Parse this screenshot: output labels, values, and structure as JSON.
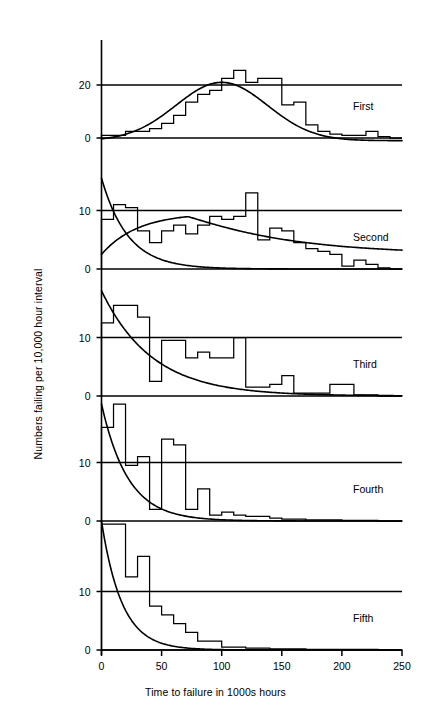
{
  "figure": {
    "ylabel": "Numbers failing per 10,000 hour interval",
    "xlabel": "Time to failure in 1000s hours",
    "top_cropped_caption": "",
    "width": 431,
    "height": 713,
    "line_color": "#000000",
    "background": "#ffffff"
  },
  "chart_data": {
    "type": "line",
    "title": "",
    "subtitle": "",
    "xlabel": "Time to failure in 1000s hours",
    "ylabel": "Numbers failing per 10,000 hour interval",
    "xlim": [
      0,
      250
    ],
    "xticks": [
      0,
      50,
      100,
      150,
      200,
      250
    ],
    "xticklabels": [
      "0",
      "50",
      "100",
      "150",
      "200",
      "250"
    ],
    "grid": false,
    "legend": "none",
    "annotations": [
      "First",
      "Second",
      "Third",
      "Fourth",
      "Fifth"
    ],
    "panel_layout": "5 stacked panels sharing one x-axis",
    "panels": [
      {
        "label": "First",
        "ylim": [
          0,
          26
        ],
        "yticks": [
          0,
          20
        ],
        "yticklabels": [
          "0",
          "20"
        ],
        "bin_width": 10,
        "bin_edges": [
          0,
          10,
          20,
          30,
          40,
          50,
          60,
          70,
          80,
          90,
          100,
          110,
          120,
          130,
          140,
          150,
          160,
          170,
          180,
          190,
          200,
          210,
          220,
          230,
          240,
          250
        ],
        "histogram": [
          1.0,
          1.0,
          2.5,
          2.5,
          3.5,
          5.5,
          8.5,
          13.5,
          16.5,
          18.0,
          22.5,
          25.5,
          21.0,
          22.5,
          22.5,
          12.5,
          13.5,
          5.0,
          2.5,
          1.5,
          1.0,
          1.0,
          2.5,
          0.5,
          0.0
        ],
        "curves": [
          {
            "name": "normal-fit",
            "kind": "gaussian",
            "peak_value": 21.0,
            "mean": 100,
            "sigma": 38,
            "baseline": -1.0
          }
        ]
      },
      {
        "label": "Second",
        "ylim": [
          0,
          16
        ],
        "yticks": [
          0,
          10
        ],
        "yticklabels": [
          "0",
          "10"
        ],
        "bin_width": 10,
        "bin_edges": [
          0,
          10,
          20,
          30,
          40,
          50,
          60,
          70,
          80,
          90,
          100,
          110,
          120,
          130,
          140,
          150,
          160,
          170,
          180,
          190,
          200,
          210,
          220,
          230,
          240,
          250
        ],
        "histogram": [
          8.5,
          11.0,
          10.5,
          6.5,
          4.5,
          6.5,
          7.5,
          6.0,
          7.5,
          9.0,
          8.5,
          9.0,
          13.0,
          5.0,
          7.0,
          6.5,
          4.5,
          3.5,
          3.0,
          2.5,
          0.5,
          1.5,
          0.8,
          0.2,
          0.0
        ],
        "curves": [
          {
            "name": "decaying-exponential",
            "kind": "exponential-decay",
            "y0": 15.5,
            "decay_scale": 22,
            "baseline": 0
          },
          {
            "name": "rising-hump",
            "kind": "hump",
            "y_start": 2.5,
            "peak_value": 9.6,
            "peak_x": 72,
            "tail_value": 0.2
          }
        ]
      },
      {
        "label": "Third",
        "ylim": [
          0,
          18
        ],
        "yticks": [
          0,
          10
        ],
        "yticklabels": [
          "0",
          "10"
        ],
        "bin_width": 10,
        "bin_edges": [
          0,
          10,
          20,
          30,
          40,
          50,
          60,
          70,
          80,
          90,
          100,
          110,
          120,
          130,
          140,
          150,
          160,
          170,
          180,
          190,
          200,
          210,
          220,
          230,
          240,
          250
        ],
        "histogram": [
          12.5,
          15.5,
          15.5,
          13.5,
          2.5,
          9.5,
          9.5,
          6.5,
          7.5,
          6.5,
          6.5,
          10.0,
          1.5,
          1.5,
          2.0,
          3.5,
          0.5,
          0.5,
          0.5,
          2.0,
          2.0,
          0.2,
          0.2,
          0.0,
          0.0
        ],
        "curves": [
          {
            "name": "exponential-fit",
            "kind": "exponential-decay",
            "y0": 18.0,
            "decay_scale": 42,
            "baseline": 0
          }
        ]
      },
      {
        "label": "Fourth",
        "ylim": [
          0,
          20
        ],
        "yticks": [
          0,
          10
        ],
        "yticklabels": [
          "0",
          "10"
        ],
        "bin_width": 10,
        "bin_edges": [
          0,
          10,
          20,
          30,
          40,
          50,
          60,
          70,
          80,
          90,
          100,
          110,
          120,
          130,
          140,
          150,
          160,
          170,
          180,
          190,
          200,
          210,
          220,
          230,
          240,
          250
        ],
        "histogram": [
          16.0,
          20.0,
          9.5,
          11.0,
          2.0,
          14.0,
          13.0,
          2.0,
          5.5,
          1.0,
          1.5,
          1.0,
          0.8,
          0.8,
          0.5,
          0.3,
          0.3,
          0.2,
          0.2,
          0.2,
          0.1,
          0.1,
          0.1,
          0.0,
          0.0
        ],
        "curves": [
          {
            "name": "exponential-fit",
            "kind": "exponential-decay",
            "y0": 20.0,
            "decay_scale": 22,
            "baseline": 0
          }
        ]
      },
      {
        "label": "Fifth",
        "ylim": [
          0,
          22
        ],
        "yticks": [
          0,
          10
        ],
        "yticklabels": [
          "0",
          "10"
        ],
        "bin_width": 10,
        "bin_edges": [
          0,
          10,
          20,
          30,
          40,
          50,
          60,
          70,
          80,
          90,
          100,
          110,
          120,
          130,
          140,
          150,
          160,
          170,
          180,
          190,
          200,
          210,
          220,
          230,
          240,
          250
        ],
        "histogram": [
          21.5,
          21.5,
          12.5,
          16.0,
          7.5,
          6.0,
          4.5,
          3.0,
          1.5,
          1.5,
          0.5,
          0.5,
          0.3,
          0.3,
          0.2,
          0.2,
          0.2,
          0.1,
          0.1,
          0.1,
          0.1,
          0.1,
          0.1,
          0.0,
          0.0
        ],
        "curves": [
          {
            "name": "exponential-fit",
            "kind": "exponential-decay",
            "y0": 22.0,
            "decay_scale": 17,
            "baseline": 0
          }
        ]
      }
    ]
  }
}
